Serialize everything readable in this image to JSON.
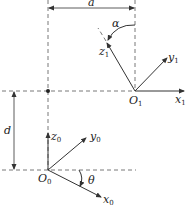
{
  "diagram": {
    "type": "coordinate-frame-transformation",
    "labels": {
      "a": "a",
      "d": "d",
      "alpha": "α",
      "theta": "θ"
    },
    "frame1": {
      "origin": {
        "main": "O",
        "sub": "1"
      },
      "x": {
        "main": "x",
        "sub": "1"
      },
      "y": {
        "main": "y",
        "sub": "1"
      },
      "z": {
        "main": "z",
        "sub": "1"
      }
    },
    "frame0": {
      "origin": {
        "main": "O",
        "sub": "0"
      },
      "x": {
        "main": "x",
        "sub": "0"
      },
      "y": {
        "main": "y",
        "sub": "0"
      },
      "z": {
        "main": "z",
        "sub": "0"
      }
    },
    "colors": {
      "line": "#333333",
      "dashed": "#555555",
      "background": "#ffffff"
    }
  }
}
